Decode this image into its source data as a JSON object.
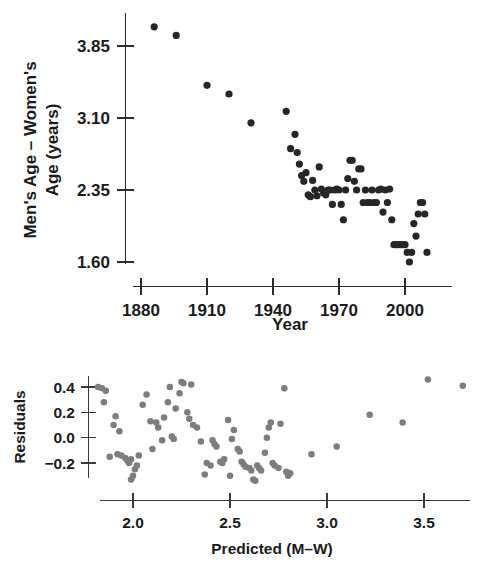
{
  "figure": {
    "title_visible": false,
    "background_color": "#ffffff"
  },
  "panels": {
    "main": {
      "name": "age-difference-scatterplot",
      "ylabel_line1": "Men's Age – Women's",
      "ylabel_line2": "Age (years)",
      "xlabel": "Year",
      "y_ticks": [
        "3.85",
        "3.10",
        "2.35",
        "1.60"
      ],
      "x_ticks": [
        "1880",
        "1910",
        "1940",
        "1970",
        "2000"
      ],
      "marker_color": "#262626"
    },
    "residual": {
      "name": "residual-scatterplot",
      "ylabel": "Residuals",
      "xlabel": "Predicted (M–W)",
      "y_ticks": [
        "0.4",
        "0.2",
        "0.0",
        "−0.2"
      ],
      "x_ticks": [
        "2.0",
        "2.5",
        "3.0",
        "3.5"
      ],
      "marker_color": "#7d7d7d"
    }
  },
  "chart_data": [
    {
      "type": "scatter",
      "id": "main-scatter",
      "title": "",
      "xlabel": "Year",
      "ylabel": "Men's Age – Women's Age (years)",
      "xlim": [
        1874,
        2014
      ],
      "ylim": [
        1.52,
        4.22
      ],
      "xticks": [
        1880,
        1910,
        1940,
        1970,
        2000
      ],
      "yticks": [
        3.85,
        3.1,
        2.35,
        1.6
      ],
      "grid": false,
      "legend": null,
      "marker_color": "#262626",
      "marker_size": 6,
      "x": [
        1886,
        1896,
        1910,
        1920,
        1930,
        1946,
        1948,
        1950,
        1951,
        1952,
        1953,
        1954,
        1955,
        1956,
        1957,
        1958,
        1959,
        1960,
        1961,
        1962,
        1963,
        1964,
        1965,
        1966,
        1967,
        1968,
        1969,
        1970,
        1971,
        1972,
        1973,
        1974,
        1975,
        1976,
        1977,
        1978,
        1979,
        1980,
        1981,
        1982,
        1983,
        1984,
        1985,
        1986,
        1987,
        1988,
        1989,
        1990,
        1991,
        1992,
        1993,
        1994,
        1995,
        1996,
        1997,
        1998,
        1999,
        2000,
        2001,
        2002,
        2003,
        2004,
        2005,
        2006,
        2007,
        2008,
        2009,
        2010
      ],
      "y": [
        4.05,
        3.96,
        3.44,
        3.35,
        3.05,
        3.17,
        2.78,
        2.93,
        2.74,
        2.62,
        2.5,
        2.44,
        2.53,
        2.3,
        2.28,
        2.45,
        2.35,
        2.29,
        2.59,
        2.36,
        2.32,
        2.3,
        2.35,
        2.35,
        2.2,
        2.35,
        2.36,
        2.35,
        2.2,
        2.04,
        2.35,
        2.47,
        2.66,
        2.66,
        2.44,
        2.35,
        2.57,
        2.57,
        2.22,
        2.35,
        2.22,
        2.22,
        2.35,
        2.22,
        2.22,
        2.35,
        2.36,
        2.12,
        2.35,
        2.22,
        2.36,
        2.04,
        1.78,
        1.78,
        1.78,
        1.78,
        1.78,
        1.78,
        1.7,
        1.6,
        1.7,
        2.0,
        1.87,
        2.1,
        2.22,
        2.22,
        2.1,
        1.7
      ]
    },
    {
      "type": "scatter",
      "id": "residual-scatter",
      "title": "",
      "xlabel": "Predicted (M–W)",
      "ylabel": "Residuals",
      "xlim": [
        1.79,
        3.74
      ],
      "ylim": [
        -0.4,
        0.52
      ],
      "xticks": [
        2.0,
        2.5,
        3.0,
        3.5
      ],
      "yticks": [
        0.4,
        0.2,
        0.0,
        -0.2
      ],
      "grid": false,
      "legend": null,
      "marker_color": "#7d7d7d",
      "marker_size": 5.5,
      "x": [
        1.82,
        1.84,
        1.86,
        1.85,
        1.88,
        1.9,
        1.91,
        1.93,
        1.92,
        1.94,
        1.96,
        1.97,
        1.98,
        1.99,
        2.0,
        2.01,
        2.02,
        1.99,
        2.03,
        2.05,
        2.07,
        2.09,
        2.1,
        2.12,
        2.13,
        2.15,
        2.16,
        2.18,
        2.19,
        2.2,
        2.21,
        2.22,
        2.24,
        2.25,
        2.26,
        2.28,
        2.29,
        2.3,
        2.31,
        2.33,
        2.35,
        2.37,
        2.38,
        2.4,
        2.41,
        2.42,
        2.43,
        2.45,
        2.46,
        2.47,
        2.49,
        2.5,
        2.51,
        2.52,
        2.54,
        2.55,
        2.56,
        2.57,
        2.58,
        2.6,
        2.61,
        2.62,
        2.63,
        2.64,
        2.65,
        2.66,
        2.68,
        2.69,
        2.7,
        2.71,
        2.72,
        2.73,
        2.75,
        2.76,
        2.78,
        2.79,
        2.8,
        2.81,
        2.92,
        3.05,
        3.22,
        3.39,
        3.52,
        3.7
      ],
      "y": [
        0.4,
        0.39,
        0.37,
        0.28,
        -0.15,
        0.1,
        0.17,
        0.05,
        -0.13,
        -0.14,
        -0.16,
        -0.18,
        -0.2,
        -0.33,
        -0.3,
        -0.25,
        -0.22,
        -0.17,
        -0.14,
        0.26,
        0.34,
        0.13,
        -0.09,
        0.12,
        0.08,
        -0.02,
        0.16,
        0.28,
        0.4,
        0.01,
        -0.01,
        0.23,
        0.35,
        0.44,
        0.43,
        0.2,
        0.15,
        0.42,
        0.1,
        0.08,
        -0.03,
        -0.29,
        -0.2,
        -0.22,
        -0.02,
        -0.05,
        -0.07,
        -0.19,
        -0.2,
        -0.17,
        0.14,
        -0.3,
        -0.01,
        0.06,
        -0.09,
        -0.11,
        -0.19,
        -0.21,
        -0.23,
        -0.24,
        -0.26,
        -0.33,
        -0.34,
        -0.22,
        -0.24,
        -0.26,
        -0.12,
        0.0,
        0.08,
        0.12,
        -0.2,
        -0.22,
        -0.24,
        0.11,
        0.39,
        -0.27,
        -0.3,
        -0.28,
        -0.13,
        -0.07,
        0.18,
        0.12,
        0.46,
        0.41
      ]
    }
  ]
}
